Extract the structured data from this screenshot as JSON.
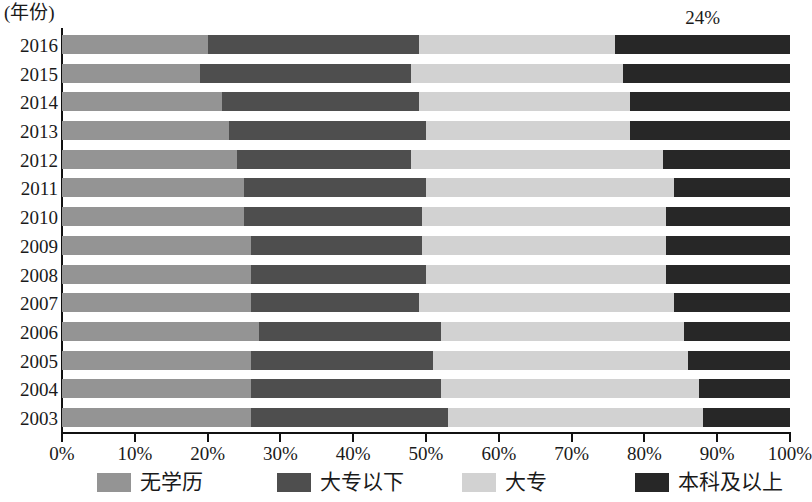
{
  "axis_corner_label": "(年份)",
  "legend": {
    "items": [
      {
        "label": "无学历",
        "color": "#949494",
        "key": "none"
      },
      {
        "label": "大专以下",
        "color": "#4e4e4e",
        "key": "sub_college"
      },
      {
        "label": "大专",
        "color": "#d2d2d2",
        "key": "college"
      },
      {
        "label": "本科及以上",
        "color": "#272727",
        "key": "bachelor_plus"
      }
    ]
  },
  "annotations": [
    {
      "text": "24%",
      "series": "本科及以上",
      "category": "2016",
      "value": 24
    }
  ],
  "chart_data": {
    "type": "bar",
    "orientation": "horizontal",
    "stacked": true,
    "stack_total": 100,
    "title": "",
    "subtitle": "",
    "xlabel": "",
    "ylabel": "(年份)",
    "xlim": [
      0,
      100
    ],
    "grid": false,
    "legend_position": "bottom",
    "xtick_labels": [
      "0%",
      "10%",
      "20%",
      "30%",
      "40%",
      "50%",
      "60%",
      "70%",
      "80%",
      "90%",
      "100%"
    ],
    "xtick_values": [
      0,
      10,
      20,
      30,
      40,
      50,
      60,
      70,
      80,
      90,
      100
    ],
    "categories": [
      "2016",
      "2015",
      "2014",
      "2013",
      "2012",
      "2011",
      "2010",
      "2009",
      "2008",
      "2007",
      "2006",
      "2005",
      "2004",
      "2003"
    ],
    "series": [
      {
        "name": "无学历",
        "color": "#949494",
        "values": [
          20.0,
          19.0,
          22.0,
          23.0,
          24.0,
          25.0,
          25.0,
          26.0,
          26.0,
          26.0,
          27.0,
          26.0,
          26.0,
          26.0
        ]
      },
      {
        "name": "大专以下",
        "color": "#4e4e4e",
        "values": [
          29.0,
          29.0,
          27.0,
          27.0,
          24.0,
          25.0,
          24.5,
          23.5,
          24.0,
          23.0,
          25.0,
          25.0,
          26.0,
          27.0
        ]
      },
      {
        "name": "大专",
        "color": "#d2d2d2",
        "values": [
          27.0,
          29.0,
          29.0,
          28.0,
          34.5,
          34.0,
          33.5,
          33.5,
          33.0,
          35.0,
          33.5,
          35.0,
          35.5,
          35.0
        ]
      },
      {
        "name": "本科及以上",
        "color": "#272727",
        "values": [
          24.0,
          23.0,
          22.0,
          22.0,
          17.5,
          16.0,
          17.0,
          17.0,
          17.0,
          16.0,
          14.5,
          14.0,
          12.5,
          12.0
        ]
      }
    ]
  }
}
